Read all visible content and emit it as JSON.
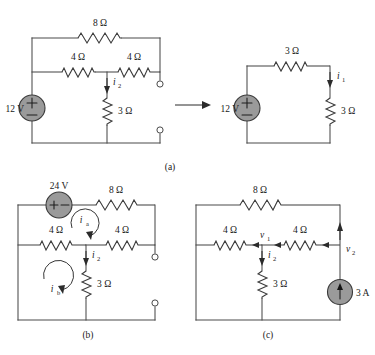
{
  "figure": {
    "captions": {
      "a": "(a)",
      "b": "(b)",
      "c": "(c)"
    },
    "ohm_symbol": "Ω",
    "ampere_symbol": "A",
    "volt_symbol": "V"
  },
  "circuit_a": {
    "name": "circuit-a",
    "left": {
      "source": {
        "label": "12 V",
        "type": "voltage-source",
        "orientation": "vertical",
        "plus": "+",
        "minus": "−"
      },
      "resistors": [
        {
          "id": "r-top-8",
          "label": "8 Ω",
          "position": "top-branch"
        },
        {
          "id": "r-mid-left-4",
          "label": "4 Ω",
          "position": "middle-left"
        },
        {
          "id": "r-mid-right-4",
          "label": "4 Ω",
          "position": "middle-right"
        },
        {
          "id": "r-shunt-3",
          "label": "3 Ω",
          "position": "vertical-shunt"
        }
      ],
      "currents": [
        {
          "id": "i2",
          "symbol": "i",
          "subscript": "2",
          "direction": "down"
        }
      ],
      "terminals": [
        {
          "id": "terminal-top",
          "type": "open-circle"
        },
        {
          "id": "terminal-bottom",
          "type": "open-circle"
        }
      ]
    },
    "transform_arrow": {
      "name": "equivalence-arrow",
      "direction": "right"
    },
    "right": {
      "source": {
        "label": "12 V",
        "type": "voltage-source",
        "orientation": "vertical",
        "plus": "+",
        "minus": "−"
      },
      "resistors": [
        {
          "id": "r-top-3",
          "label": "3 Ω",
          "position": "top-branch"
        },
        {
          "id": "r-right-3",
          "label": "3 Ω",
          "position": "right-vertical"
        }
      ],
      "currents": [
        {
          "id": "i1",
          "symbol": "i",
          "subscript": "1",
          "direction": "down"
        }
      ]
    }
  },
  "circuit_b": {
    "name": "circuit-b",
    "source": {
      "label": "24 V",
      "type": "voltage-source",
      "orientation": "horizontal",
      "plus": "+",
      "minus": "−"
    },
    "resistors": [
      {
        "id": "r-top-8",
        "label": "8 Ω",
        "position": "top-branch"
      },
      {
        "id": "r-mid-left-4",
        "label": "4 Ω",
        "position": "middle-left"
      },
      {
        "id": "r-mid-right-4",
        "label": "4 Ω",
        "position": "middle-right"
      },
      {
        "id": "r-shunt-3",
        "label": "3 Ω",
        "position": "vertical-shunt"
      }
    ],
    "mesh_currents": [
      {
        "id": "ia",
        "symbol": "i",
        "subscript": "a",
        "direction": "clockwise"
      },
      {
        "id": "ib",
        "symbol": "i",
        "subscript": "b",
        "direction": "clockwise"
      }
    ],
    "currents": [
      {
        "id": "i2",
        "symbol": "i",
        "subscript": "2",
        "direction": "down"
      }
    ],
    "terminals": [
      {
        "id": "terminal-top",
        "type": "open-circle"
      },
      {
        "id": "terminal-bottom",
        "type": "open-circle"
      }
    ]
  },
  "circuit_c": {
    "name": "circuit-c",
    "source": {
      "label": "3 A",
      "type": "current-source",
      "orientation": "vertical",
      "direction": "up"
    },
    "resistors": [
      {
        "id": "r-top-8",
        "label": "8 Ω",
        "position": "top-branch"
      },
      {
        "id": "r-mid-left-4",
        "label": "4 Ω",
        "position": "middle-left"
      },
      {
        "id": "r-mid-right-4",
        "label": "4 Ω",
        "position": "middle-right"
      },
      {
        "id": "r-shunt-3",
        "label": "3 Ω",
        "position": "vertical-shunt"
      }
    ],
    "nodes": [
      {
        "id": "v1",
        "symbol": "v",
        "subscript": "1"
      },
      {
        "id": "v2",
        "symbol": "v",
        "subscript": "2"
      }
    ],
    "currents": [
      {
        "id": "i2",
        "symbol": "i",
        "subscript": "2",
        "direction": "down"
      }
    ]
  },
  "colors": {
    "wire": "#4a4a4a",
    "source_fill": "#9a9a9a",
    "text": "#1a1a1a",
    "background": "#ffffff"
  }
}
